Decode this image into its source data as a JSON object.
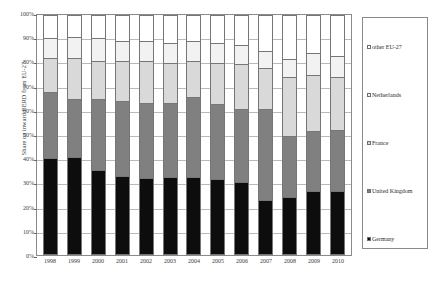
{
  "chart_data": {
    "type": "bar",
    "subtype": "stacked-100-percent",
    "title": "",
    "xlabel": "",
    "ylabel": "Share on inward BERD from EU-27",
    "ylim": [
      0,
      100
    ],
    "yunit": "%",
    "grid": true,
    "legend_position": "right",
    "ytick_labels": [
      "100%",
      "90%",
      "80%",
      "70%",
      "60%",
      "50%",
      "40%",
      "30%",
      "20%",
      "10%",
      "0%"
    ],
    "ytick_values": [
      100,
      90,
      80,
      70,
      60,
      50,
      40,
      30,
      20,
      10,
      0
    ],
    "categories": [
      "1998",
      "1999",
      "2000",
      "2001",
      "2002",
      "2003",
      "2004",
      "2005",
      "2006",
      "2007",
      "2008",
      "2009",
      "2010"
    ],
    "series": [
      {
        "name": "Germany",
        "color": "#0d0d0d",
        "values": [
          40.5,
          41.0,
          35.5,
          33.0,
          32.0,
          32.5,
          32.5,
          31.5,
          30.5,
          23.0,
          24.0,
          26.5,
          26.5
        ]
      },
      {
        "name": "United Kingdom",
        "color": "#808080",
        "values": [
          27.5,
          24.0,
          29.5,
          31.0,
          31.5,
          31.0,
          33.5,
          31.5,
          30.5,
          38.0,
          25.5,
          25.0,
          25.5
        ]
      },
      {
        "name": "France",
        "color": "#d9d9d9",
        "values": [
          14.0,
          17.0,
          16.0,
          17.0,
          17.5,
          16.5,
          15.0,
          17.0,
          18.5,
          17.0,
          24.5,
          23.5,
          22.0
        ]
      },
      {
        "name": "Netherlands",
        "color": "#f2f2f2",
        "values": [
          8.5,
          9.0,
          9.5,
          8.0,
          8.0,
          8.5,
          8.0,
          8.5,
          8.0,
          7.0,
          7.5,
          9.0,
          9.0
        ]
      },
      {
        "name": "other EU-27",
        "color": "#ffffff",
        "values": [
          9.5,
          9.0,
          9.5,
          11.0,
          11.0,
          11.5,
          11.0,
          11.5,
          12.5,
          15.0,
          18.5,
          16.0,
          17.0
        ]
      }
    ]
  },
  "legend": {
    "entries": [
      {
        "label": "other EU-27",
        "color": "#ffffff"
      },
      {
        "label": "Netherlands",
        "color": "#f2f2f2"
      },
      {
        "label": "France",
        "color": "#d9d9d9"
      },
      {
        "label": "United Kingdom",
        "color": "#808080"
      },
      {
        "label": "Germany",
        "color": "#0d0d0d"
      }
    ]
  }
}
